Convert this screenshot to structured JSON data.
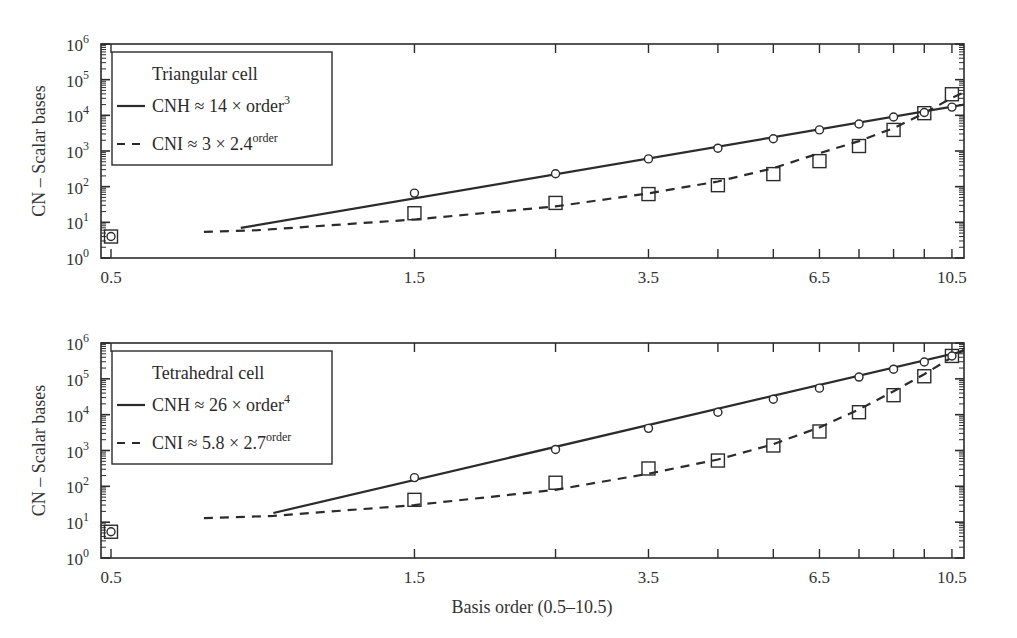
{
  "figure": {
    "xlabel": "Basis order (0.5–10.5)",
    "ylabel": "CN – Scalar bases"
  },
  "chart_data": [
    {
      "type": "scatter",
      "title": "Triangular cell",
      "xlabel": "",
      "ylabel": "CN – Scalar bases",
      "xscale": "log",
      "yscale": "log",
      "xlim": [
        0.47,
        11.0
      ],
      "ylim": [
        1,
        1000000
      ],
      "x_tick_labels": [
        "0.5",
        "1.5",
        "3.5",
        "6.5",
        "10.5"
      ],
      "x_ticks": [
        0.5,
        1.5,
        2.5,
        3.5,
        4.5,
        5.5,
        6.5,
        7.5,
        8.5,
        9.5,
        10.5
      ],
      "y_tick_labels": [
        "10^0",
        "10^1",
        "10^2",
        "10^3",
        "10^4",
        "10^5",
        "10^6"
      ],
      "grid": false,
      "legend_position": "upper-left",
      "legend": {
        "title": "Triangular cell",
        "entries": [
          {
            "style": "solid",
            "label": "CNH ≈ 14 × order",
            "sup": "3"
          },
          {
            "style": "dashed",
            "label": "CNI ≈ 3 × 2.4",
            "sup": "order"
          }
        ]
      },
      "series": [
        {
          "name": "CNH (circles)",
          "marker": "circle",
          "x": [
            0.5,
            1.5,
            2.5,
            3.5,
            4.5,
            5.5,
            6.5,
            7.5,
            8.5,
            9.5,
            10.5
          ],
          "y": [
            4,
            66,
            230,
            600,
            1200,
            2200,
            3900,
            5700,
            9000,
            12000,
            17000
          ]
        },
        {
          "name": "CNI (squares)",
          "marker": "square",
          "x": [
            0.5,
            1.5,
            2.5,
            3.5,
            4.5,
            5.5,
            6.5,
            7.5,
            8.5,
            9.5,
            10.5
          ],
          "y": [
            4,
            18,
            35,
            62,
            110,
            225,
            520,
            1380,
            3900,
            11500,
            39000
          ]
        },
        {
          "name": "CNH fit",
          "line": "solid",
          "x": [
            0.8,
            11.0
          ],
          "y": [
            7,
            20000
          ]
        },
        {
          "name": "CNI fit",
          "line": "dashed",
          "x": [
            0.7,
            0.85,
            1.5,
            2.5,
            3.5,
            4.5,
            5.5,
            6.5,
            7.5,
            8.5,
            9.5,
            10.5,
            11.0
          ],
          "y": [
            5.4,
            6,
            12,
            28,
            65,
            140,
            330,
            870,
            1900,
            4400,
            11500,
            31000,
            45000
          ]
        }
      ]
    },
    {
      "type": "scatter",
      "title": "Tetrahedral cell",
      "xlabel": "Basis order (0.5–10.5)",
      "ylabel": "CN – Scalar bases",
      "xscale": "log",
      "yscale": "log",
      "xlim": [
        0.47,
        11.0
      ],
      "ylim": [
        1,
        1000000
      ],
      "x_tick_labels": [
        "0.5",
        "1.5",
        "3.5",
        "6.5",
        "10.5"
      ],
      "x_ticks": [
        0.5,
        1.5,
        2.5,
        3.5,
        4.5,
        5.5,
        6.5,
        7.5,
        8.5,
        9.5,
        10.5
      ],
      "y_tick_labels": [
        "10^0",
        "10^1",
        "10^2",
        "10^3",
        "10^4",
        "10^5",
        "10^6"
      ],
      "grid": false,
      "legend_position": "upper-left",
      "legend": {
        "title": "Tetrahedral cell",
        "entries": [
          {
            "style": "solid",
            "label": "CNH ≈ 26 × order",
            "sup": "4"
          },
          {
            "style": "dashed",
            "label": "CNI ≈ 5.8 × 2.7",
            "sup": "order"
          }
        ]
      },
      "series": [
        {
          "name": "CNH (circles)",
          "marker": "circle",
          "x": [
            0.5,
            1.5,
            2.5,
            3.5,
            4.5,
            5.5,
            6.5,
            7.5,
            8.5,
            9.5,
            10.5
          ],
          "y": [
            5.4,
            175,
            1070,
            4150,
            11700,
            27000,
            55000,
            112000,
            186000,
            295000,
            435000
          ]
        },
        {
          "name": "CNI (squares)",
          "marker": "square",
          "x": [
            0.5,
            1.5,
            2.5,
            3.5,
            4.5,
            5.5,
            6.5,
            7.5,
            8.5,
            9.5,
            10.5
          ],
          "y": [
            5.4,
            42,
            126,
            315,
            525,
            1380,
            3400,
            11700,
            35000,
            118000,
            435000
          ]
        },
        {
          "name": "CNH fit",
          "line": "solid",
          "x": [
            0.9,
            11.0
          ],
          "y": [
            18,
            600000
          ]
        },
        {
          "name": "CNI fit",
          "line": "dashed",
          "x": [
            0.7,
            0.9,
            1.5,
            2.5,
            3.5,
            4.5,
            5.5,
            6.5,
            7.5,
            8.5,
            9.5,
            10.5,
            11.0
          ],
          "y": [
            13,
            15,
            30,
            80,
            225,
            560,
            1500,
            4400,
            14000,
            45000,
            135000,
            400000,
            680000
          ]
        }
      ]
    }
  ]
}
